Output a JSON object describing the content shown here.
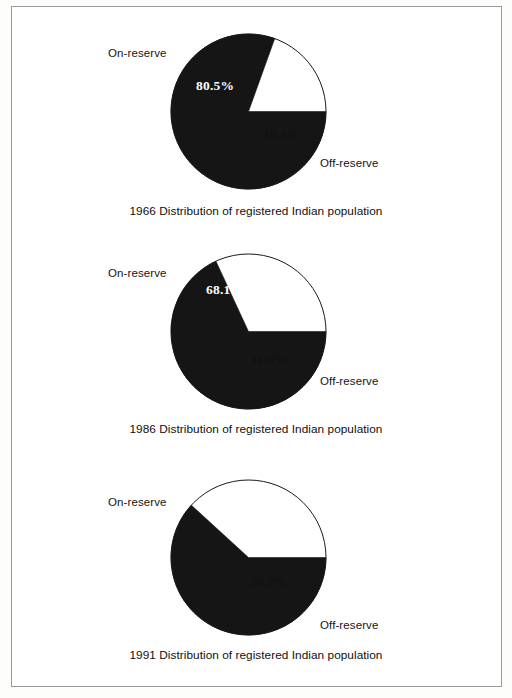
{
  "document": {
    "type": "scanned-figure-page",
    "frame_color": "#9a9a9a",
    "background": "#ffffff"
  },
  "palette": {
    "on_reserve_fill": "#151515",
    "off_reserve_fill": "#ffffff",
    "outline": "#1a1a1a",
    "text": "#101010",
    "on_reserve_text": "#ffffff"
  },
  "charts": [
    {
      "id": "chart-1966",
      "caption": "1966 Distribution of registered Indian population",
      "on_label": "On-reserve",
      "off_label": "Off-reserve",
      "on_value_text": "80.5%",
      "off_value_text": "19.5%",
      "chart_data": {
        "type": "pie",
        "title": "1966 Distribution of registered Indian population",
        "labels": [
          "On-reserve",
          "Off-reserve"
        ],
        "values": [
          80.5,
          19.5
        ],
        "units": "percent",
        "colors": [
          "#151515",
          "#ffffff"
        ],
        "start_angle_deg": 90,
        "direction": "clockwise",
        "legend": "labels-outside"
      }
    },
    {
      "id": "chart-1986",
      "caption": "1986 Distribution of registered Indian population",
      "on_label": "On-reserve",
      "off_label": "Off-reserve",
      "on_value_text": "68.1%",
      "off_value_text": "31.9%",
      "chart_data": {
        "type": "pie",
        "title": "1986 Distribution of registered Indian population",
        "labels": [
          "On-reserve",
          "Off-reserve"
        ],
        "values": [
          68.1,
          31.9
        ],
        "units": "percent",
        "colors": [
          "#151515",
          "#ffffff"
        ],
        "start_angle_deg": 90,
        "direction": "clockwise",
        "legend": "labels-outside"
      }
    },
    {
      "id": "chart-1991",
      "caption": "1991 Distribution of registered Indian population",
      "on_label": "On-reserve",
      "off_label": "Off-reserve",
      "on_value_text": "61.8",
      "off_value_text": "38.2%",
      "chart_data": {
        "type": "pie",
        "title": "1991 Distribution of registered Indian population",
        "labels": [
          "On-reserve",
          "Off-reserve"
        ],
        "values": [
          61.8,
          38.2
        ],
        "units": "percent",
        "colors": [
          "#151515",
          "#ffffff"
        ],
        "start_angle_deg": 90,
        "direction": "clockwise",
        "legend": "labels-outside"
      }
    }
  ]
}
